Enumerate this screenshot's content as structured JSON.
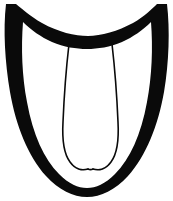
{
  "image": {
    "kind": "line-drawing",
    "subject": "shield-outline-with-two-inner-strands",
    "background_color": "#ffffff",
    "ink_color": "#0a0a0a",
    "width_px": 173,
    "height_px": 201,
    "text_content": "",
    "caption": ""
  },
  "shapes": {
    "outer_body": {
      "name": "thick-shield-border",
      "description": "Closed black band forming a shield/sole silhouette: concave crescent across the top, pointed upper corners, bowed sides, rounded U-shaped bottom",
      "color": "#0a0a0a",
      "outer_path": "M 6 4 L 16 4 C 22 9 30 16 42 23 C 58 32 75 36 88 36 C 101 36 118 31 133 23 C 145 16 152 9 157 4 L 167 4 C 170 30 169 62 164 92 C 158 126 146 156 128 176 C 115 190 101 197 87 197 C 73 197 59 190 46 176 C 28 156 16 126 10 92 C 5 62 3 30 6 4 Z",
      "inner_path": "M 23 22 C 21 48 22 76 27 102 C 33 135 44 159 59 174 C 69 184 78 188 87 188 C 96 188 105 184 115 174 C 130 159 141 135 147 102 C 152 76 153 48 151 22 C 143 30 133 37 122 42 C 110 47 98 49 87 49 C 76 49 64 47 52 42 C 41 37 31 30 23 22 Z"
    },
    "left_strand": {
      "name": "left-inner-strand",
      "description": "Thin line descending from under the top crescent, bowing slightly left then hooking outward and down into the bottom band",
      "color": "#0a0a0a",
      "stroke_width": 1.6,
      "path": "M 69 44 C 66 70 64 98 63 122 C 62 140 64 154 70 162 C 75 169 82 171 88 169"
    },
    "right_strand": {
      "name": "right-inner-strand",
      "description": "Mirror of the left strand, descending and hooking outward to the right into the bottom band",
      "color": "#0a0a0a",
      "stroke_width": 1.6,
      "path": "M 112 44 C 115 70 117 98 118 122 C 119 140 117 154 111 162 C 106 169 99 171 93 169"
    },
    "center_seam": {
      "name": "center-seam-join",
      "description": "Short joining curve where the two strands meet above the bottom band",
      "color": "#0a0a0a",
      "stroke_width": 1.6,
      "path": "M 88 169 C 90 170 91 170 93 169"
    }
  }
}
